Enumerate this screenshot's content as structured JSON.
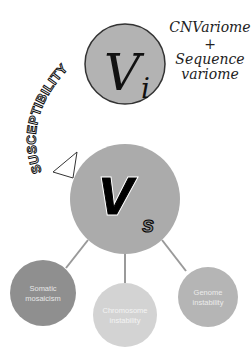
{
  "diagram": {
    "top_node": {
      "symbol_main": "V",
      "symbol_sub": "i",
      "fill": "#b3b3b3",
      "stroke": "#333333"
    },
    "top_annotation": {
      "line1": "CNVariome",
      "line2": "+",
      "line3": "Sequence",
      "line4": "variome"
    },
    "arc_label": "SUSCEPTIBILITY",
    "main_node": {
      "symbol_main": "V",
      "symbol_sub": "s",
      "fill": "#ababab"
    },
    "child_nodes": [
      {
        "label_line1": "Somatic",
        "label_line2": "mosaicism",
        "fill": "#8f8f8f"
      },
      {
        "label_line1": "Chromosome",
        "label_line2": "instability",
        "fill": "#d3d3d3"
      },
      {
        "label_line1": "Genome",
        "label_line2": "instability",
        "fill": "#b5b5b5"
      }
    ],
    "connector_color": "#9a9a9a"
  }
}
